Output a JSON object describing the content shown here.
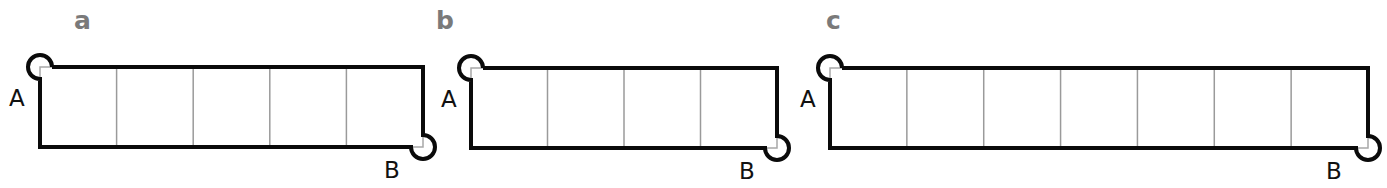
{
  "diagram": {
    "colors": {
      "outline": "#0a0a0a",
      "cell_divider": "#9a9a9a",
      "panel_label": "#7a7a7a",
      "point_label": "#111111"
    },
    "panels": [
      {
        "label": "a",
        "cells": 5,
        "start_label": "A",
        "end_label": "B",
        "x_left": 40,
        "x_right": 423,
        "y_top": 67,
        "y_bottom": 147,
        "label_x": 74,
        "label_y": 29,
        "a_label_x": 9,
        "a_label_y": 106,
        "b_label_x": 384,
        "b_label_y": 178
      },
      {
        "label": "b",
        "cells": 4,
        "start_label": "A",
        "end_label": "B",
        "x_left": 471,
        "x_right": 777,
        "y_top": 68,
        "y_bottom": 148,
        "label_x": 436,
        "label_y": 29,
        "a_label_x": 441,
        "a_label_y": 107,
        "b_label_x": 739,
        "b_label_y": 179
      },
      {
        "label": "c",
        "cells": 7,
        "start_label": "A",
        "end_label": "B",
        "x_left": 830,
        "x_right": 1368,
        "y_top": 68,
        "y_bottom": 148,
        "label_x": 826,
        "label_y": 29,
        "a_label_x": 800,
        "a_label_y": 107,
        "b_label_x": 1326,
        "b_label_y": 179
      }
    ]
  }
}
